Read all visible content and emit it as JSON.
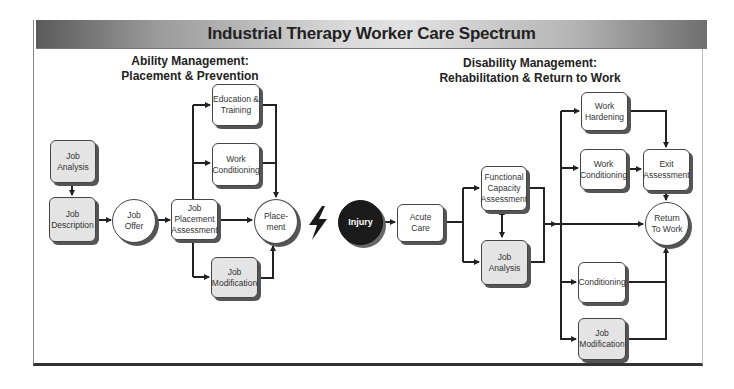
{
  "title": "Industrial Therapy Worker Care Spectrum",
  "sections": {
    "ability": {
      "line1": "Ability Management:",
      "line2": "Placement & Prevention"
    },
    "disability": {
      "line1": "Disability Management:",
      "line2": "Rehabilitation & Return to Work"
    }
  },
  "nodes": {
    "job_analysis_left": "Job\nAnalysis",
    "job_description": "Job\nDescription",
    "job_offer": "Job\nOffer",
    "job_placement_assessment": "Job\nPlacement\nAssessment",
    "education_training": "Education &\nTraining",
    "work_conditioning_left": "Work\nConditioning",
    "job_modification_left": "Job\nModification",
    "placement": "Place-\nment",
    "injury": "Injury",
    "acute_care": "Acute\nCare",
    "functional_capacity_assessment": "Functional\nCapacity\nAssessment",
    "job_analysis_right": "Job\nAnalysis",
    "work_hardening": "Work\nHardening",
    "work_conditioning_right": "Work\nConditioning",
    "exit_assessment": "Exit\nAssessment",
    "return_to_work": "Return\nTo Work",
    "conditioning": "Conditioning",
    "job_modification_right": "Job\nModification"
  },
  "icons": {
    "injury_event": "lightning-bolt"
  },
  "colors": {
    "shaded_box": "#e4e4e4",
    "injury": "#1b1b1b",
    "line": "#222222"
  }
}
